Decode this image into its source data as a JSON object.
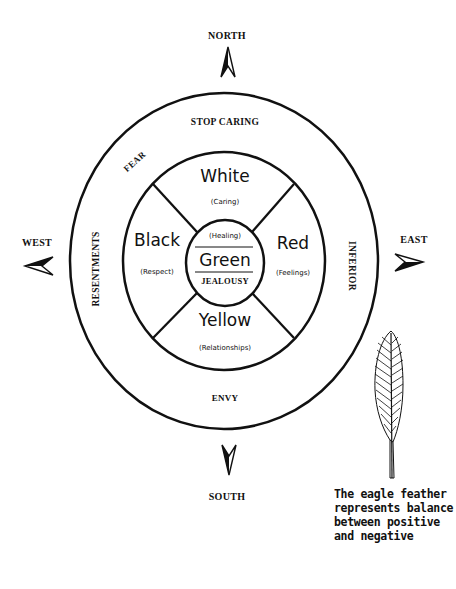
{
  "directions": {
    "north": "NORTH",
    "south": "SOUTH",
    "east": "EAST",
    "west": "WEST"
  },
  "outer_ring": {
    "top": "STOP CARING",
    "upper_left": "FEAR",
    "left": "RESENTMENTS",
    "right": "INFERIOR",
    "bottom": "ENVY"
  },
  "quadrants": {
    "north": {
      "color": "White",
      "meaning": "(Caring)"
    },
    "west": {
      "color": "Black",
      "meaning": "(Respect)"
    },
    "east": {
      "color": "Red",
      "meaning": "(Feelings)"
    },
    "south": {
      "color": "Yellow",
      "meaning": "(Relationships)"
    }
  },
  "center": {
    "top": "(Healing)",
    "color": "Green",
    "bottom": "JEALOUSY"
  },
  "feather_caption": [
    "The eagle feather",
    "represents balance",
    "between positive",
    "and negative"
  ],
  "colors": {
    "ink": "#111111",
    "background": "#ffffff"
  }
}
